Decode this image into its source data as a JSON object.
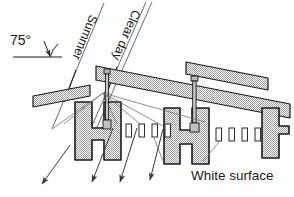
{
  "diagram": {
    "angle_label": "75°",
    "ray_label_summer": "Summer",
    "ray_label_clearday": "Clear day",
    "surface_label": "White surface",
    "colors": {
      "shelf_fill": "#d2d2d2",
      "shelf_outline": "#1a1a1a",
      "ray_line": "#4a4a4a",
      "text": "#1a1a1a",
      "white_surface_fill": "#ffffff",
      "post_fill": "#c8c8c8"
    },
    "elements": {
      "sun_angle_deg": 75,
      "white_surface_count_left": 4,
      "white_surface_count_right": 4,
      "incoming_ray_count": 2,
      "reflected_ray_count": 3,
      "shelf_count": 3,
      "post_count": 2
    }
  }
}
